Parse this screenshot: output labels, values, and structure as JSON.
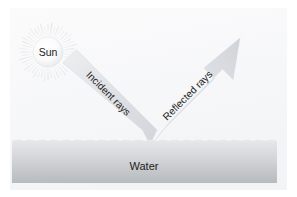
{
  "figure": {
    "background_color": "#ffffff",
    "panel_color": "#f7f8f9"
  },
  "sun": {
    "label": "Sun",
    "icon": "sun-icon",
    "disc_color": "#fdfdfd",
    "ray_color": "#c9ccd1",
    "center_x": 48,
    "center_y": 52,
    "disc_radius": 15,
    "ray_outer_radius": 30,
    "ray_count": 48
  },
  "incident": {
    "label": "Incident rays",
    "icon": "arrow-down-right-icon",
    "band_color": "#dcdfe3",
    "angle_deg": 45
  },
  "reflected": {
    "label": "Reflected rays",
    "icon": "arrow-up-right-icon",
    "band_color": "#dcdfe3",
    "angle_deg": -45
  },
  "water": {
    "label": "Water",
    "top_color": "#e2e4e7",
    "bottom_color": "#b9bcc0",
    "surface_y": 141,
    "bottom_y": 183,
    "left_x": 12,
    "right_x": 277,
    "wave_count": 22
  }
}
